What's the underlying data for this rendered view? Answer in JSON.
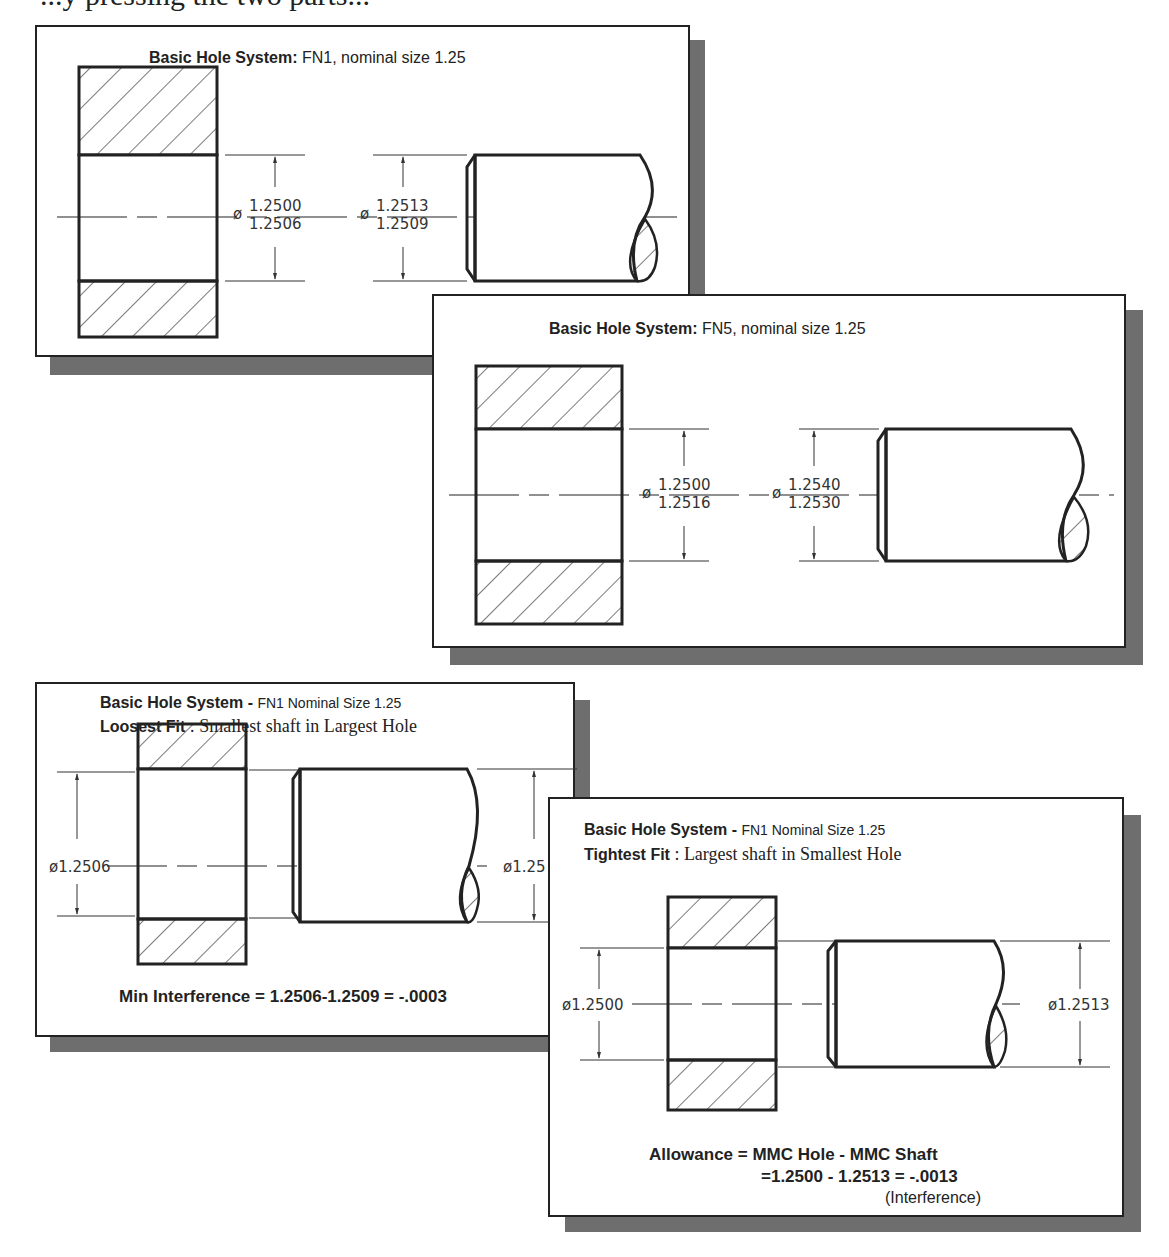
{
  "page": {
    "top_text": "...y pressing the two parts..."
  },
  "panels": {
    "fn1": {
      "title_bold": "Basic Hole System:",
      "title_light": "FN1, nominal size 1.25",
      "hole_dim": {
        "symbol": "ø",
        "upper": "1.2500",
        "lower": "1.2506"
      },
      "shaft_dim": {
        "symbol": "ø",
        "upper": "1.2513",
        "lower": "1.2509"
      }
    },
    "fn5": {
      "title_bold": "Basic Hole System:",
      "title_light": "FN5, nominal size 1.25",
      "hole_dim": {
        "symbol": "ø",
        "upper": "1.2500",
        "lower": "1.2516"
      },
      "shaft_dim": {
        "symbol": "ø",
        "upper": "1.2540",
        "lower": "1.2530"
      }
    },
    "loosest": {
      "title_bold": "Basic Hole System -",
      "title_small": "FN1 Nominal Size 1.25",
      "subtitle_bold": "Loosest Fit",
      "subtitle_rest": ": Smallest shaft in Largest Hole",
      "hole_dim": "ø1.2506",
      "shaft_dim": "ø1.25",
      "formula": "Min Interference = 1.2506-1.2509 = -.0003"
    },
    "tightest": {
      "title_bold": "Basic Hole System -",
      "title_small": "FN1 Nominal Size 1.25",
      "subtitle_bold": "Tightest Fit",
      "subtitle_rest": ": Largest shaft in Smallest Hole",
      "hole_dim": "ø1.2500",
      "shaft_dim": "ø1.2513",
      "formula_line1": "Allowance = MMC Hole - MMC Shaft",
      "formula_line2": "=1.2500 - 1.2513 = -.0013",
      "formula_line3": "(Interference)"
    }
  }
}
